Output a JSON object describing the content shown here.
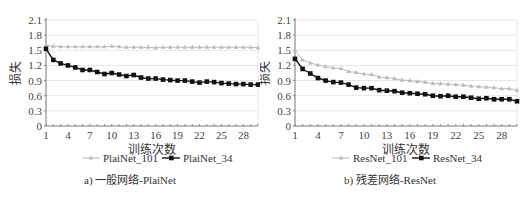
{
  "chart_data": [
    {
      "type": "line",
      "title": "a) 一般网络-PlaiNet",
      "xlabel": "训练次数",
      "ylabel": "损失",
      "ylim": [
        0,
        2.1
      ],
      "yticks": [
        "0",
        "0.3",
        "0.6",
        "0.9",
        "1.2",
        "1.5",
        "1.8",
        "2.1"
      ],
      "xticks": [
        "1",
        "4",
        "7",
        "10",
        "13",
        "16",
        "19",
        "22",
        "25",
        "28"
      ],
      "grid": true,
      "legend_position": "bottom",
      "x": [
        1,
        2,
        3,
        4,
        5,
        6,
        7,
        8,
        9,
        10,
        11,
        12,
        13,
        14,
        15,
        16,
        17,
        18,
        19,
        20,
        21,
        22,
        23,
        24,
        25,
        26,
        27,
        28,
        29,
        30
      ],
      "series": [
        {
          "name": "PlaiNet_101",
          "color": "#bbbbbb",
          "marker": "triangle",
          "values": [
            1.6,
            1.58,
            1.57,
            1.57,
            1.57,
            1.57,
            1.57,
            1.57,
            1.57,
            1.58,
            1.57,
            1.56,
            1.56,
            1.56,
            1.56,
            1.55,
            1.56,
            1.56,
            1.56,
            1.56,
            1.56,
            1.56,
            1.56,
            1.56,
            1.56,
            1.56,
            1.56,
            1.56,
            1.56,
            1.55
          ]
        },
        {
          "name": "PlaiNet_34",
          "color": "#111111",
          "marker": "square",
          "values": [
            1.53,
            1.31,
            1.24,
            1.2,
            1.16,
            1.11,
            1.11,
            1.07,
            1.03,
            1.05,
            1.02,
            0.99,
            1.01,
            0.96,
            0.94,
            0.94,
            0.92,
            0.91,
            0.9,
            0.9,
            0.88,
            0.86,
            0.88,
            0.87,
            0.85,
            0.84,
            0.83,
            0.83,
            0.82,
            0.82
          ]
        }
      ]
    },
    {
      "type": "line",
      "title": "b) 残差网络-ResNet",
      "xlabel": "训练次数",
      "ylabel": "损失",
      "ylim": [
        0,
        2.1
      ],
      "yticks": [
        "0",
        "0.3",
        "0.6",
        "0.9",
        "1.2",
        "1.5",
        "1.8",
        "2.1"
      ],
      "xticks": [
        "1",
        "4",
        "7",
        "10",
        "13",
        "16",
        "19",
        "22",
        "25",
        "28"
      ],
      "grid": true,
      "legend_position": "bottom",
      "x": [
        1,
        2,
        3,
        4,
        5,
        6,
        7,
        8,
        9,
        10,
        11,
        12,
        13,
        14,
        15,
        16,
        17,
        18,
        19,
        20,
        21,
        22,
        23,
        24,
        25,
        26,
        27,
        28,
        29,
        30
      ],
      "series": [
        {
          "name": "ResNet_101",
          "color": "#bbbbbb",
          "marker": "triangle",
          "values": [
            1.5,
            1.31,
            1.25,
            1.21,
            1.18,
            1.15,
            1.14,
            1.08,
            1.06,
            1.03,
            1.02,
            0.97,
            0.96,
            0.94,
            0.91,
            0.9,
            0.88,
            0.87,
            0.84,
            0.84,
            0.83,
            0.82,
            0.81,
            0.79,
            0.78,
            0.77,
            0.76,
            0.74,
            0.74,
            0.71
          ]
        },
        {
          "name": "ResNet_34",
          "color": "#111111",
          "marker": "square",
          "values": [
            1.33,
            1.13,
            1.04,
            0.95,
            0.9,
            0.87,
            0.86,
            0.82,
            0.76,
            0.75,
            0.75,
            0.71,
            0.7,
            0.69,
            0.66,
            0.65,
            0.64,
            0.63,
            0.6,
            0.59,
            0.6,
            0.58,
            0.58,
            0.56,
            0.54,
            0.55,
            0.53,
            0.53,
            0.53,
            0.49
          ]
        }
      ]
    }
  ]
}
